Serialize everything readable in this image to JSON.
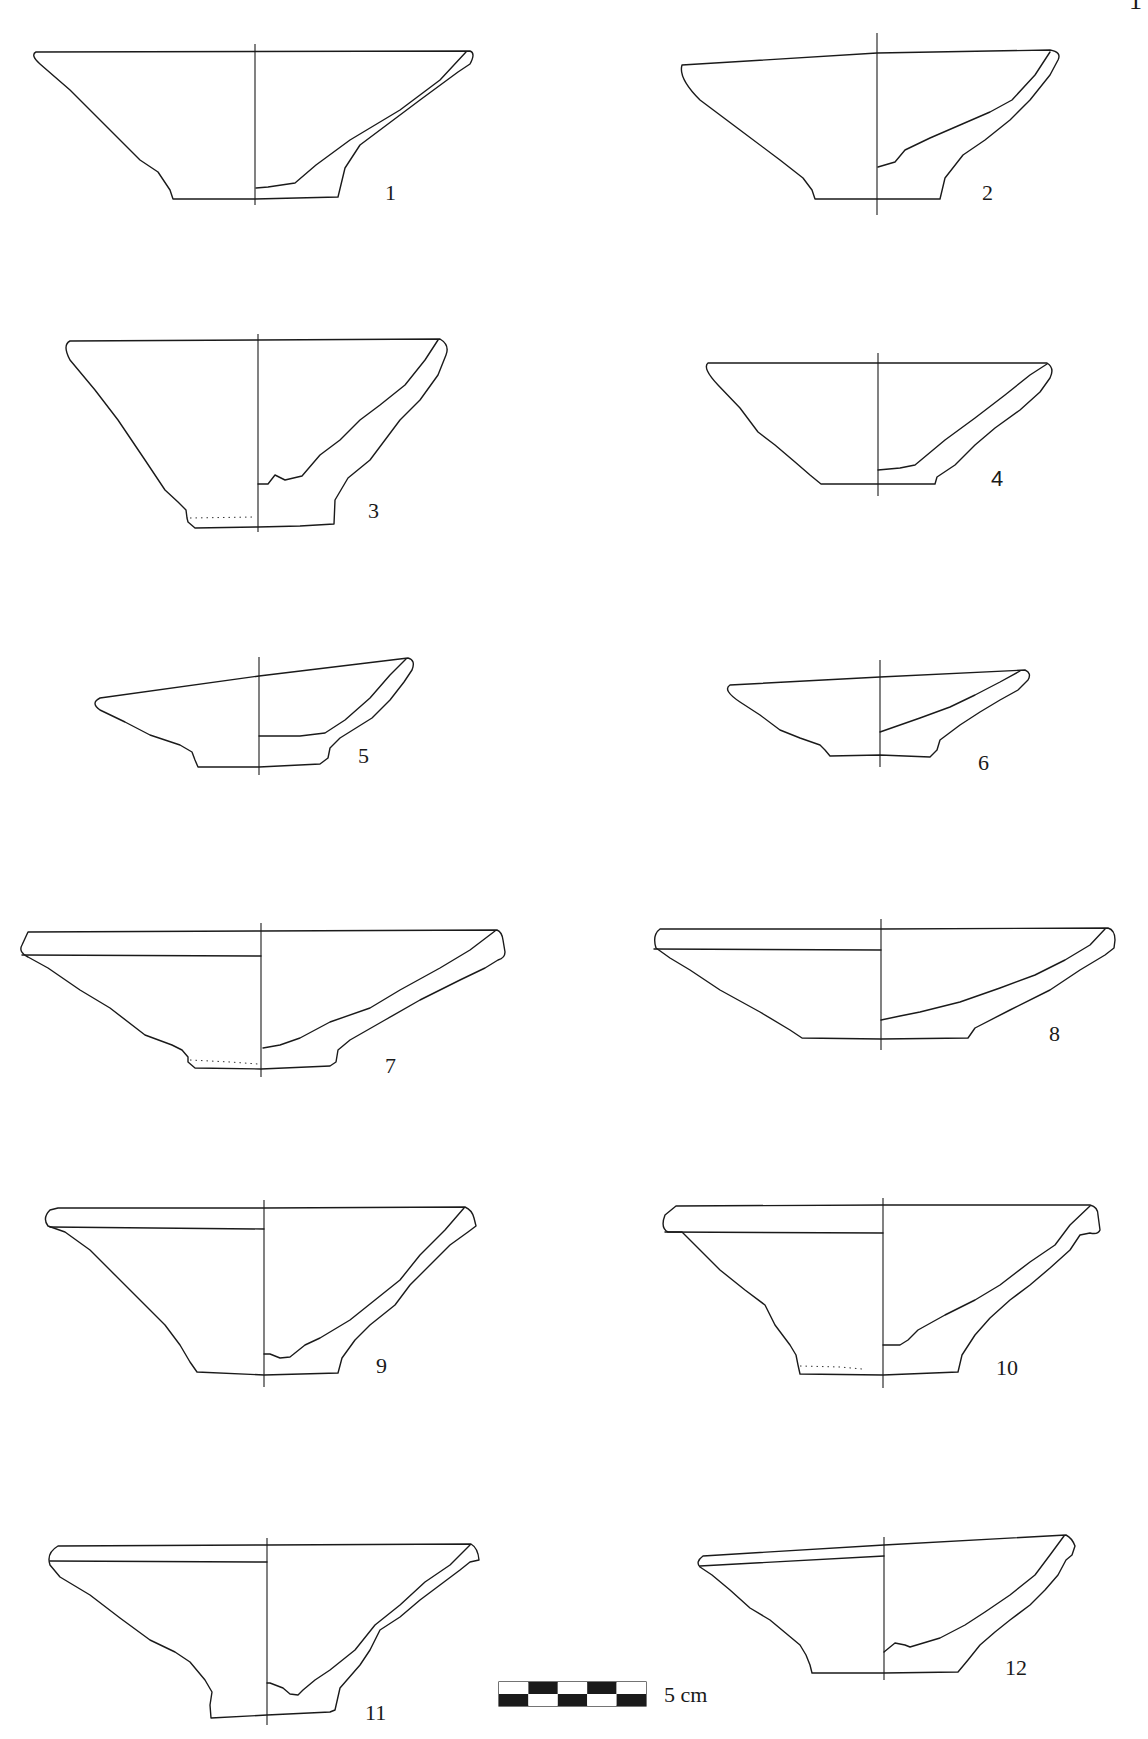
{
  "page": {
    "page_number_fragment": "1",
    "kind": "archaeological pottery plate — bowl profiles (section/elevation)"
  },
  "figures": [
    {
      "id": 1,
      "label": "1",
      "rim": "plain flaring",
      "foot": "flat base"
    },
    {
      "id": 2,
      "label": "2",
      "rim": "plain flaring, slightly sloped",
      "foot": "flat base"
    },
    {
      "id": 3,
      "label": "3",
      "rim": "plain flaring",
      "foot": "ring foot, dotted restoration line"
    },
    {
      "id": 4,
      "label": "4",
      "rim": "plain flaring",
      "foot": "flat base"
    },
    {
      "id": 5,
      "label": "5",
      "rim": "sloped/distorted",
      "foot": "low ring foot"
    },
    {
      "id": 6,
      "label": "6",
      "rim": "sloped/distorted",
      "foot": "low ring foot"
    },
    {
      "id": 7,
      "label": "7",
      "rim": "everted band rim",
      "foot": "ring foot"
    },
    {
      "id": 8,
      "label": "8",
      "rim": "everted band rim",
      "foot": "flat base"
    },
    {
      "id": 9,
      "label": "9",
      "rim": "everted band rim",
      "foot": "flat base"
    },
    {
      "id": 10,
      "label": "10",
      "rim": "everted band rim",
      "foot": "ring foot"
    },
    {
      "id": 11,
      "label": "11",
      "rim": "everted band rim",
      "foot": "ring foot"
    },
    {
      "id": 12,
      "label": "12",
      "rim": "sloped band rim",
      "foot": "flat base"
    }
  ],
  "scale_bar": {
    "label": "5 cm",
    "length_cm": 5,
    "segments": 5
  },
  "colors": {
    "ink": "#1a1a1a",
    "paper": "#ffffff"
  }
}
